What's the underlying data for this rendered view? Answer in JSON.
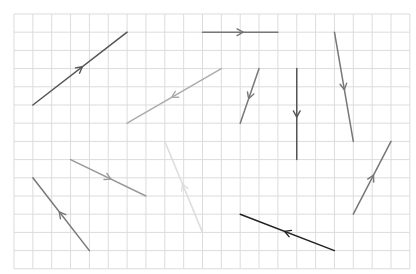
{
  "diagram": {
    "type": "vector-field-grid",
    "grid": {
      "origin_x": 14,
      "origin_y": 14,
      "cell_w": 18.85,
      "cell_h": 18.2,
      "cols": 21,
      "rows": 14,
      "line_color": "#dcdcdc"
    },
    "vectors": [
      {
        "id": "vector-a",
        "from": [
          1,
          5
        ],
        "to": [
          6,
          1
        ],
        "color": "#555555"
      },
      {
        "id": "vector-b",
        "from": [
          11,
          3
        ],
        "to": [
          6,
          6
        ],
        "color": "#ababab"
      },
      {
        "id": "vector-c",
        "from": [
          10,
          1
        ],
        "to": [
          14,
          1
        ],
        "color": "#777777"
      },
      {
        "id": "vector-d",
        "from": [
          13,
          3
        ],
        "to": [
          12,
          6
        ],
        "color": "#777777"
      },
      {
        "id": "vector-e",
        "from": [
          15,
          3
        ],
        "to": [
          15,
          8
        ],
        "color": "#555555"
      },
      {
        "id": "vector-f",
        "from": [
          17,
          1
        ],
        "to": [
          18,
          7
        ],
        "color": "#777777"
      },
      {
        "id": "vector-g",
        "from": [
          18,
          11
        ],
        "to": [
          20,
          7
        ],
        "color": "#777777"
      },
      {
        "id": "vector-h",
        "from": [
          10,
          12
        ],
        "to": [
          8,
          7
        ],
        "color": "#dddddd"
      },
      {
        "id": "vector-i",
        "from": [
          3,
          8
        ],
        "to": [
          7,
          10
        ],
        "color": "#999999"
      },
      {
        "id": "vector-j",
        "from": [
          4,
          13
        ],
        "to": [
          1,
          9
        ],
        "color": "#777777"
      },
      {
        "id": "vector-k",
        "from": [
          17,
          13
        ],
        "to": [
          12,
          11
        ],
        "color": "#222222"
      }
    ]
  }
}
